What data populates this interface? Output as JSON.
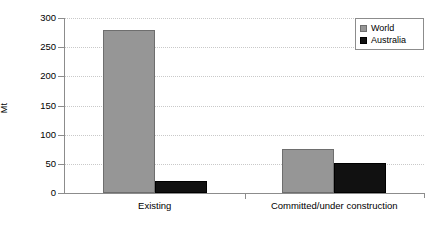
{
  "chart_data": {
    "type": "bar",
    "title": "",
    "subtitle": "",
    "xlabel": "",
    "ylabel": "Mt",
    "categories": [
      "Existing",
      "Committed/under construction"
    ],
    "series": [
      {
        "name": "World",
        "color": "#969696",
        "values": [
          280,
          75
        ]
      },
      {
        "name": "Australia",
        "color": "#111111",
        "values": [
          21,
          52
        ]
      }
    ],
    "ylim": [
      0,
      300
    ],
    "yticks": [
      0,
      50,
      100,
      150,
      200,
      250,
      300
    ],
    "ytick_labels": [
      "0",
      "50",
      "100",
      "150",
      "200",
      "250",
      "300"
    ],
    "grid": true,
    "legend_position": "top-right"
  },
  "legend": {
    "entries": [
      {
        "label": "World"
      },
      {
        "label": "Australia"
      }
    ]
  },
  "axis": {
    "y_title": "Mt"
  }
}
